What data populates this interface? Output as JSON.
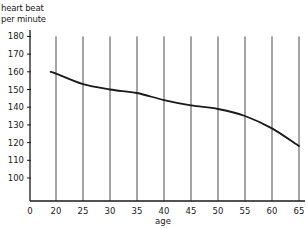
{
  "chart_data": {
    "type": "line",
    "title": "",
    "xlabel": "age",
    "ylabel": "heart beat per minute",
    "ylabel_lines": [
      "heart beat",
      "per minute"
    ],
    "x_ticks": [
      0,
      20,
      25,
      30,
      35,
      40,
      45,
      50,
      55,
      60,
      65
    ],
    "y_ticks": [
      100,
      110,
      120,
      130,
      140,
      150,
      160,
      170,
      180
    ],
    "xlim": [
      0,
      65
    ],
    "ylim": [
      100,
      180
    ],
    "grid": "vertical lines at each x tick from 20 to 65",
    "legend": null,
    "series": [
      {
        "name": "heart beat per minute",
        "color": "#1a1a1a",
        "x": [
          19,
          20,
          25,
          30,
          35,
          40,
          45,
          50,
          55,
          60,
          65
        ],
        "values": [
          160,
          159,
          153,
          150,
          148,
          144,
          141,
          139,
          135,
          128,
          118
        ]
      }
    ]
  }
}
